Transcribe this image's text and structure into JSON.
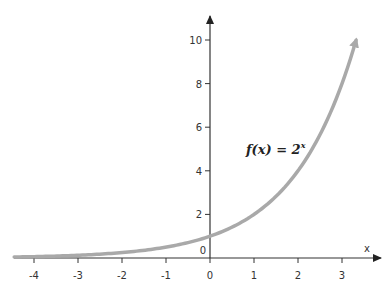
{
  "chart_data": {
    "type": "line",
    "title": "",
    "xlabel": "x",
    "ylabel": "",
    "annotation": "f(x) = 2^x",
    "annotation_parts": {
      "base": "f(x) = 2",
      "exp": "x"
    },
    "xlim": [
      -4.45,
      3.6
    ],
    "ylim": [
      0,
      10.8
    ],
    "x_ticks": [
      -4,
      -3,
      -2,
      -1,
      0,
      1,
      2,
      3
    ],
    "y_ticks": [
      2,
      4,
      6,
      8,
      10
    ],
    "origin_label": "0",
    "grid": false,
    "legend": null,
    "series": [
      {
        "name": "f(x) = 2^x",
        "x": [
          -4.45,
          -4,
          -3,
          -2,
          -1,
          0,
          1,
          2,
          3,
          3.32
        ],
        "values": [
          0.046,
          0.0625,
          0.125,
          0.25,
          0.5,
          1,
          2,
          4,
          8,
          10.0
        ],
        "color": "#a9a9a9",
        "end_arrow": true
      }
    ]
  },
  "colors": {
    "axis": "#333333",
    "curve": "#a9a9a9"
  }
}
